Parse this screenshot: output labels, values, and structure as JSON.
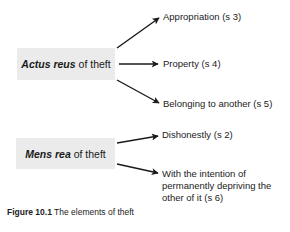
{
  "diagram": {
    "nodes": {
      "actus": {
        "emphasis": "Actus reus",
        "rest": " of theft"
      },
      "mens": {
        "emphasis": "Mens rea",
        "rest": " of theft"
      }
    },
    "actus_children": [
      {
        "label": "Appropriation (s 3)"
      },
      {
        "label": "Property (s 4)"
      },
      {
        "label": "Belonging to another (s 5)"
      }
    ],
    "mens_children": [
      {
        "label": "Dishonestly (s 2)"
      },
      {
        "line1": "With the intention of",
        "line2": "permanently depriving the",
        "line3": "other of it (s 6)"
      }
    ],
    "colors": {
      "box_fill": "#ebebeb",
      "arrow": "#1a1a1a",
      "text": "#222222"
    }
  },
  "caption": {
    "figure_label": "Figure 10.1",
    "text": " The elements of theft"
  }
}
